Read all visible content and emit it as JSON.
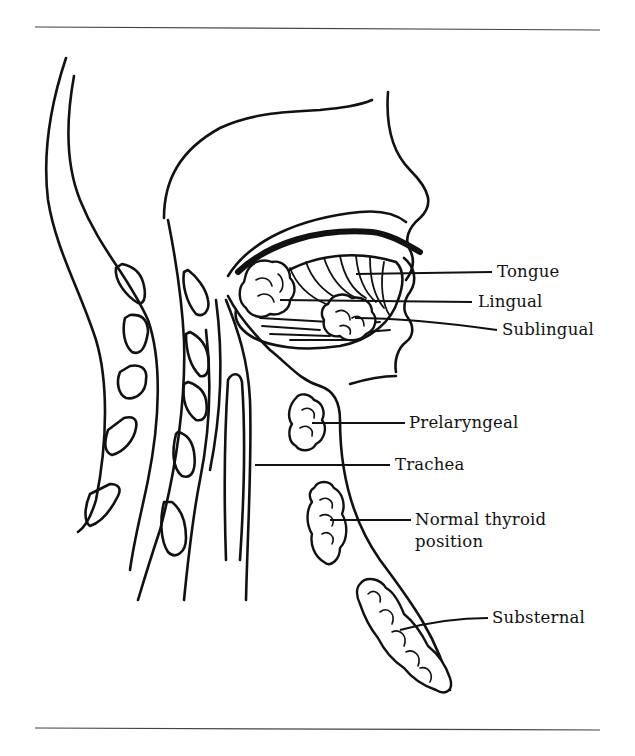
{
  "figure": {
    "colors": {
      "ink": "#111111",
      "background": "#ffffff",
      "rule": "#444444"
    },
    "labels": [
      {
        "id": "tongue",
        "text": "Tongue"
      },
      {
        "id": "lingual",
        "text": "Lingual"
      },
      {
        "id": "sublingual",
        "text": "Sublingual"
      },
      {
        "id": "prelaryngeal",
        "text": "Prelaryngeal"
      },
      {
        "id": "trachea",
        "text": "Trachea"
      },
      {
        "id": "normal_thyroid_line1",
        "text": "Normal thyroid"
      },
      {
        "id": "normal_thyroid_line2",
        "text": "position"
      },
      {
        "id": "substernal",
        "text": "Substernal"
      }
    ]
  }
}
